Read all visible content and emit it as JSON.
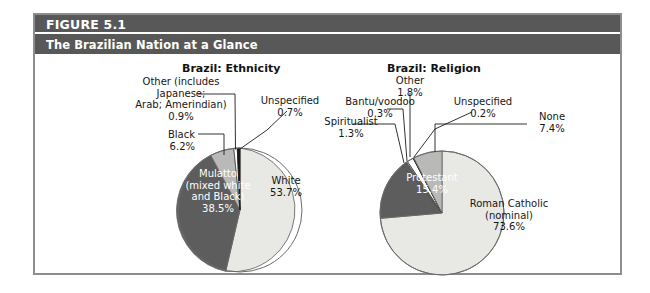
{
  "figure": {
    "number": "FIGURE 5.1",
    "subtitle": "The Brazilian Nation at a Glance"
  },
  "colors": {
    "header_band": "#585858",
    "frame_border": "#8d8d8d",
    "slice_light": "#e8e8e5",
    "slice_medium": "#b9b9b7",
    "slice_dark": "#5d5d5d",
    "slice_white": "#ffffff",
    "slice_black": "#1b1b1b",
    "outline": "#6a6a6a",
    "text": "#161616",
    "text_inverse": "#ffffff"
  },
  "chart_data": [
    {
      "type": "pie",
      "title": "Brazil: Ethnicity",
      "categories": [
        "White",
        "Mulatto (mixed white and Black)",
        "Black",
        "Other (includes Japanese; Arab; Amerindian)",
        "Unspecified"
      ],
      "values": [
        53.7,
        38.5,
        6.2,
        0.9,
        0.7
      ],
      "unit": "%",
      "labels": [
        {
          "name": "white",
          "text": "White\n53.7%",
          "value": 53.7,
          "placement": "inside",
          "color": "#e8e8e5"
        },
        {
          "name": "mulatto",
          "text": "Mulatto\n(mixed white\nand Black)\n38.5%",
          "value": 38.5,
          "placement": "inside",
          "color": "#5d5d5d"
        },
        {
          "name": "black",
          "text": "Black\n6.2%",
          "value": 6.2,
          "placement": "outside",
          "color": "#b9b9b7"
        },
        {
          "name": "other",
          "text": "Other (includes\nJapanese;\nArab; Amerindian)\n0.9%",
          "value": 0.9,
          "placement": "outside",
          "color": "#ffffff"
        },
        {
          "name": "unspecified",
          "text": "Unspecified\n0.7%",
          "value": 0.7,
          "placement": "outside",
          "color": "#1b1b1b"
        }
      ],
      "legend": "none",
      "grid": false
    },
    {
      "type": "pie",
      "title": "Brazil: Religion",
      "categories": [
        "Roman Catholic (nominal)",
        "Protestant",
        "None",
        "Other",
        "Spiritualist",
        "Bantu/voodoo",
        "Unspecified"
      ],
      "values": [
        73.6,
        15.4,
        7.4,
        1.8,
        1.3,
        0.3,
        0.2
      ],
      "unit": "%",
      "labels": [
        {
          "name": "roman-catholic",
          "text": "Roman Catholic\n(nominal)\n73.6%",
          "value": 73.6,
          "placement": "inside",
          "color": "#e8e8e5"
        },
        {
          "name": "protestant",
          "text": "Protestant\n15.4%",
          "value": 15.4,
          "placement": "inside",
          "color": "#5d5d5d"
        },
        {
          "name": "none",
          "text": "None\n7.4%",
          "value": 7.4,
          "placement": "outside",
          "color": "#b9b9b7"
        },
        {
          "name": "other",
          "text": "Other\n1.8%",
          "value": 1.8,
          "placement": "outside",
          "color": "#ffffff"
        },
        {
          "name": "spiritualist",
          "text": "Spiritualist\n1.3%",
          "value": 1.3,
          "placement": "outside",
          "color": "#5d5d5d"
        },
        {
          "name": "bantu-voodoo",
          "text": "Bantu/voodoo\n0.3%",
          "value": 0.3,
          "placement": "outside",
          "color": "#ffffff"
        },
        {
          "name": "unspecified",
          "text": "Unspecified\n0.2%",
          "value": 0.2,
          "placement": "outside",
          "color": "#1b1b1b"
        }
      ],
      "legend": "none",
      "grid": false
    }
  ],
  "ethnicity": {
    "title": "Brazil: Religion-placeholder",
    "other_label": "Other (includes\nJapanese;\nArab; Amerindian)\n0.9%",
    "unspecified_label": "Unspecified\n0.7%",
    "black_label": "Black\n6.2%",
    "mulatto_label": "Mulatto\n(mixed white\nand Black)\n38.5%",
    "white_label": "White\n53.7%"
  },
  "religion": {
    "other_label": "Other\n1.8%",
    "bantu_label": "Bantu/voodoo\n0.3%",
    "unspecified_label": "Unspecified\n0.2%",
    "spiritualist_label": "Spiritualist\n1.3%",
    "none_label": "None\n7.4%",
    "protestant_label": "Protestant\n15.4%",
    "catholic_label": "Roman Catholic\n(nominal)\n73.6%"
  }
}
